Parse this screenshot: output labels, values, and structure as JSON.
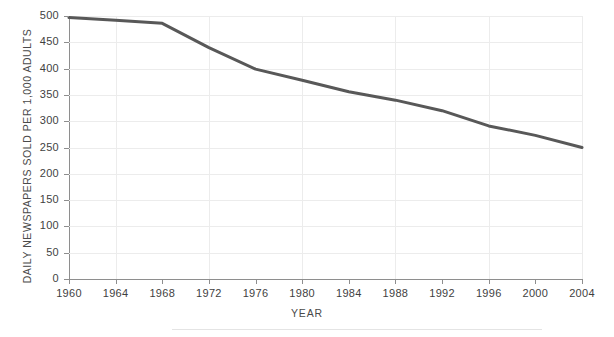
{
  "figure": {
    "title_sliver": "",
    "footer_rule": "horizontal-rule"
  },
  "axes": {
    "ylabel": "DAILY NEWSPAPERS SOLD PER 1,000 ADULTS",
    "xlabel": "YEAR",
    "ytick_labels": [
      "500",
      "450",
      "400",
      "350",
      "300",
      "250",
      "200",
      "150",
      "100",
      "50",
      "0"
    ],
    "xtick_labels": [
      "1960",
      "1964",
      "1968",
      "1972",
      "1976",
      "1980",
      "1984",
      "1988",
      "1992",
      "1996",
      "2000",
      "2004"
    ]
  },
  "colors": {
    "line": "#585858",
    "grid": "#ececec",
    "axis": "#8e8e8e",
    "text": "#3f3f3f",
    "background": "#ffffff"
  },
  "chart_data": {
    "type": "line",
    "title": "",
    "xlabel": "YEAR",
    "ylabel": "DAILY NEWSPAPERS SOLD PER 1,000 ADULTS",
    "x": [
      1960,
      1964,
      1968,
      1972,
      1976,
      1980,
      1984,
      1988,
      1992,
      1996,
      2000,
      2004
    ],
    "values": [
      497,
      492,
      486,
      440,
      399,
      378,
      356,
      340,
      320,
      291,
      273,
      250
    ],
    "series": [
      {
        "name": "Daily newspapers sold per 1,000 adults",
        "values": [
          497,
          492,
          486,
          440,
          399,
          378,
          356,
          340,
          320,
          291,
          273,
          250
        ]
      }
    ],
    "xlim": [
      1960,
      2004
    ],
    "ylim": [
      0,
      500
    ],
    "ytick_values": [
      500,
      450,
      400,
      350,
      300,
      250,
      200,
      150,
      100,
      50,
      0
    ],
    "xtick_values": [
      1960,
      1964,
      1968,
      1972,
      1976,
      1980,
      1984,
      1988,
      1992,
      1996,
      2000,
      2004
    ],
    "grid": "horizontal-and-vertical",
    "legend": "none",
    "line_color": "#585858",
    "line_width": 3
  }
}
